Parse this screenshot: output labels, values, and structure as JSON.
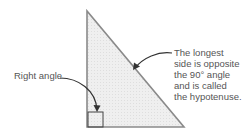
{
  "diagram": {
    "colors": {
      "fill": "#ececec",
      "stroke": "#8a8a8a",
      "box": "#444444",
      "arrow": "#333333",
      "text": "#555555"
    },
    "labels": {
      "right_angle": "Right angle",
      "hypotenuse_lines": [
        "The longest",
        "side is opposite",
        "the 90° angle",
        "and is called",
        "the hypotenuse."
      ]
    }
  }
}
